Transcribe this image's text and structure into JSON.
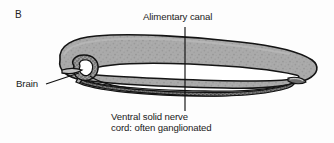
{
  "figure": {
    "panel_letter": "B",
    "background_color": "#fdfdfd",
    "width": 334,
    "height": 143
  },
  "labels": {
    "alimentary_canal": "Alimentary canal",
    "brain": "Brain",
    "nerve_cord_line1": "Ventral solid nerve",
    "nerve_cord_line2": "cord: often ganglionated"
  },
  "colors": {
    "body_fill": "#a9a9a9",
    "body_fill_light": "#b6b6b6",
    "body_outline": "#141414",
    "lumen_fill": "#ffffff",
    "nerve_cord_fill": "#5a5a5a",
    "brain_fill": "#8f8f8f",
    "text": "#1a1a1a",
    "leader_line": "#111111"
  },
  "leaders": {
    "alimentary_canal": {
      "x": 185,
      "y_top": 27,
      "y_bottom": 111
    },
    "brain": {
      "x_start": 46,
      "y_start": 84,
      "x_end": 79,
      "y_end": 73
    }
  },
  "anatomy": {
    "parts": [
      {
        "name": "body-wall",
        "description": "elongated gray stippled worm body, blunt anterior left, tapering posterior right"
      },
      {
        "name": "alimentary-canal",
        "description": "white lens-shaped gut lumen running most of body length"
      },
      {
        "name": "ventral-nerve-cord",
        "description": "dark stippled solid cord below the gut, often ganglionated"
      },
      {
        "name": "brain",
        "description": "small stippled ganglion mass at anterior with encircling nerve ring"
      }
    ]
  }
}
